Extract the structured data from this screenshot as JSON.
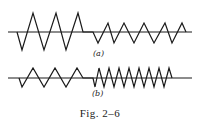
{
  "figure": {
    "caption": "Fig. 2–6",
    "caption_prefix": "Fig.",
    "caption_number": "2–6",
    "colors": {
      "stroke": "#1a1a1a",
      "background": "#ffffff"
    },
    "panels": [
      {
        "label": "(a)",
        "description": "Waveform with large-amplitude zigzag (3 cycles) followed by smaller-amplitude zigzag (about 5 cycles) at the same frequency",
        "baseline_y": 32,
        "points": "17,32 22,50 33,13 44,50 56,13 66,50 78,13 83,32 93,32 98,43 108,23 114,43 124,23 134,43 144,23 154,43 165,23 172,43 182,23 186,32"
      },
      {
        "label": "(b)",
        "description": "Waveform with low-frequency zigzag (3 cycles) followed by higher-frequency zigzag (about 8 cycles) at the same amplitude",
        "baseline_y": 78,
        "points": "19,78 22,87 33,68 44,87 55,68 66,87 77,68 83,78 93,78 95,87 99,68 104,87 109,68 114,87 119,68 124,87 129,68 134,87 139,68 144,87 149,68 154,87 159,68 164,87 169,68 172,78"
      }
    ]
  }
}
